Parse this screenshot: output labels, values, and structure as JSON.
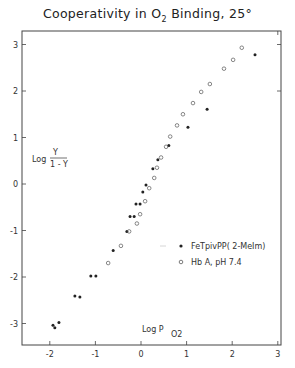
{
  "title": {
    "prefix": "Cooperativity in O",
    "sub": "2",
    "suffix": "  Binding, 25°"
  },
  "chart_data": {
    "type": "scatter",
    "title": "Cooperativity in O2 Binding, 25°",
    "xlabel": "Log P_O2",
    "ylabel": "Log Y/(1-Y)",
    "xlim": [
      -2.5,
      3.05
    ],
    "ylim": [
      -3.5,
      3.3
    ],
    "xticks": [
      -2,
      -1,
      0,
      1,
      2,
      3
    ],
    "yticks": [
      -3,
      -2,
      -1,
      0,
      1,
      2,
      3
    ],
    "grid": false,
    "legend_position": "lower right inside",
    "series": [
      {
        "name": "FeTpivPP( 2-MeIm)",
        "marker": "filled-circle",
        "x": [
          2.5,
          1.45,
          1.03,
          0.61,
          0.37,
          0.26,
          0.11,
          0.04,
          -0.02,
          -0.11,
          -0.15,
          -0.24,
          -0.31,
          -0.61,
          -0.99,
          -1.1,
          -1.34,
          -1.45,
          -1.8,
          -1.89,
          -1.93
        ],
        "y": [
          2.78,
          1.61,
          1.22,
          0.83,
          0.52,
          0.33,
          -0.02,
          -0.17,
          -0.43,
          -0.43,
          -0.7,
          -0.7,
          -1.02,
          -1.43,
          -1.98,
          -1.98,
          -2.43,
          -2.41,
          -2.98,
          -3.09,
          -3.04
        ]
      },
      {
        "name": "Hb A,  pH 7.4",
        "marker": "open-circle",
        "x": [
          2.21,
          2.02,
          1.82,
          1.51,
          1.32,
          1.14,
          0.92,
          0.79,
          0.64,
          0.55,
          0.44,
          0.35,
          0.29,
          0.18,
          0.09,
          -0.02,
          -0.09,
          -0.26,
          -0.44,
          -0.72
        ],
        "y": [
          2.93,
          2.67,
          2.48,
          2.15,
          1.98,
          1.74,
          1.5,
          1.26,
          1.02,
          0.8,
          0.57,
          0.35,
          0.13,
          -0.09,
          -0.37,
          -0.65,
          -0.85,
          -1.02,
          -1.33,
          -1.7
        ]
      }
    ]
  },
  "axes": {
    "x_label_main": "Log  P",
    "x_label_sub": "O2",
    "y_label_main": "Log",
    "y_label_num": "Y",
    "y_label_den": "1 - Y"
  },
  "legend": {
    "items": [
      {
        "label": "FeTpivPP( 2-MeIm)",
        "marker": "filled"
      },
      {
        "label": "Hb A,  pH 7.4",
        "marker": "open"
      }
    ]
  }
}
